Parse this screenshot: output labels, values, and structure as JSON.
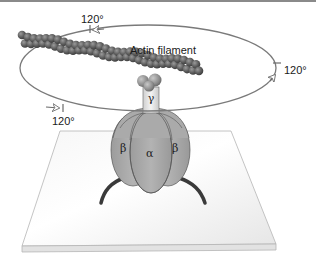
{
  "diagram": {
    "labels": {
      "actin": "Actin filament",
      "angle_top": "120°",
      "angle_right": "120°",
      "angle_bottom": "120°",
      "gamma": "γ",
      "beta_left": "β",
      "alpha": "α",
      "beta_right": "β"
    },
    "colors": {
      "top_rule": "#8a8a8a",
      "orbit": "#7a7a7a",
      "actin": "#5a5a5a",
      "subunit": "#a9a9a9",
      "platform": "#f2f2f2",
      "platform_edge": "#bdbdbd",
      "tag": "#3a3a3a"
    }
  }
}
